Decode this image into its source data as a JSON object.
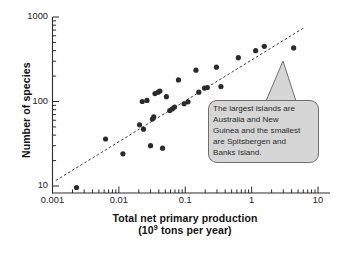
{
  "figure": {
    "name": "species-area-npp-scatter"
  },
  "axes": {
    "y_title": "Number of species",
    "x_title_line1": "Total net primary production",
    "x_title_line2_pre": "(10",
    "x_title_line2_sup": "9",
    "x_title_line2_post": " tons per year)",
    "y_ticks": [
      "10",
      "100",
      "1000"
    ],
    "x_ticks": [
      "0.001",
      "0.01",
      "0.1",
      "1",
      "10"
    ]
  },
  "callout": {
    "line1": "The largest islands are",
    "line2": "Australia and New",
    "line3": "Guinea and the smallest",
    "line4": "are Spitsbergen and",
    "line5": "Banks Island.",
    "fill": "#d6d6d6",
    "stroke": "#6f6f6f"
  },
  "chart_data": {
    "type": "scatter",
    "title": "",
    "xlabel": "Total net primary production (10^9 tons per year)",
    "ylabel": "Number of species",
    "xscale": "log",
    "yscale": "log",
    "xlim": [
      0.001,
      10
    ],
    "ylim": [
      10,
      1000
    ],
    "grid": false,
    "legend": null,
    "marker": {
      "shape": "circle",
      "color": "#2b2b2b",
      "size_px": 5.2
    },
    "points": [
      {
        "x": 0.0023,
        "y": 9.6
      },
      {
        "x": 0.0063,
        "y": 36
      },
      {
        "x": 0.0115,
        "y": 24
      },
      {
        "x": 0.0205,
        "y": 53
      },
      {
        "x": 0.0235,
        "y": 47
      },
      {
        "x": 0.0225,
        "y": 100
      },
      {
        "x": 0.0265,
        "y": 103
      },
      {
        "x": 0.03,
        "y": 30
      },
      {
        "x": 0.032,
        "y": 62
      },
      {
        "x": 0.0335,
        "y": 66
      },
      {
        "x": 0.035,
        "y": 124
      },
      {
        "x": 0.039,
        "y": 129
      },
      {
        "x": 0.0415,
        "y": 133
      },
      {
        "x": 0.0455,
        "y": 28
      },
      {
        "x": 0.052,
        "y": 114
      },
      {
        "x": 0.0585,
        "y": 78
      },
      {
        "x": 0.064,
        "y": 82
      },
      {
        "x": 0.069,
        "y": 86
      },
      {
        "x": 0.079,
        "y": 180
      },
      {
        "x": 0.096,
        "y": 94
      },
      {
        "x": 0.11,
        "y": 99
      },
      {
        "x": 0.145,
        "y": 235
      },
      {
        "x": 0.16,
        "y": 129
      },
      {
        "x": 0.195,
        "y": 144
      },
      {
        "x": 0.215,
        "y": 146
      },
      {
        "x": 0.295,
        "y": 255
      },
      {
        "x": 0.345,
        "y": 150
      },
      {
        "x": 0.63,
        "y": 330
      },
      {
        "x": 1.15,
        "y": 400
      },
      {
        "x": 1.55,
        "y": 450
      },
      {
        "x": 4.3,
        "y": 430
      }
    ],
    "trendline": {
      "style": "dashed",
      "color": "#3a3a3a",
      "x_start": 0.00112,
      "y_start": 11.6,
      "x_end": 6.4,
      "y_end": 760
    },
    "annotations": [
      {
        "type": "callout",
        "text": "The largest islands are Australia and New Guinea and the smallest are Spitsbergen and Banks Island.",
        "points_to": {
          "x": 1.55,
          "y": 450
        }
      }
    ]
  }
}
